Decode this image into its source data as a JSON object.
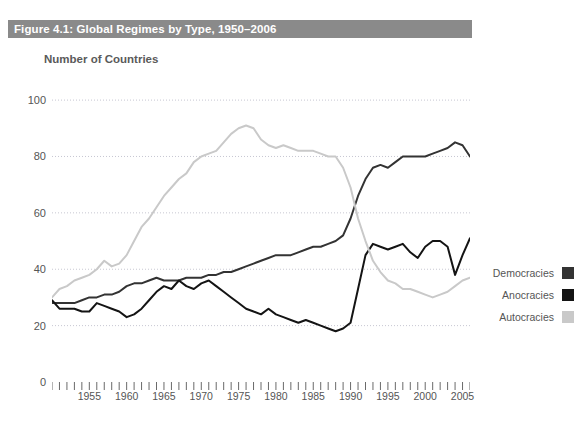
{
  "figure": {
    "title": "Figure 4.1: Global Regimes by Type, 1950–2006",
    "axis_title": "Number of Countries"
  },
  "legend": {
    "position": "right",
    "items": [
      {
        "label": "Democracies",
        "color": "#333333",
        "swatch_name": "legend-swatch-democracies"
      },
      {
        "label": "Anocracies",
        "color": "#141414",
        "swatch_name": "legend-swatch-anocracies"
      },
      {
        "label": "Autocracies",
        "color": "#c9c9c9",
        "swatch_name": "legend-swatch-autocracies"
      }
    ]
  },
  "axes": {
    "y_ticks": [
      "0",
      "20",
      "40",
      "60",
      "80",
      "100"
    ],
    "y_tick_values": [
      0,
      20,
      40,
      60,
      80,
      100
    ],
    "x_ticks": [
      "1955",
      "1960",
      "1965",
      "1970",
      "1975",
      "1980",
      "1985",
      "1990",
      "1995",
      "2000",
      "2005"
    ],
    "x_tick_values": [
      1955,
      1960,
      1965,
      1970,
      1975,
      1980,
      1985,
      1990,
      1995,
      2000,
      2005
    ],
    "grid": "horizontal-dotted"
  },
  "chart_data": {
    "type": "line",
    "title": "Figure 4.1: Global Regimes by Type, 1950–2006",
    "xlabel": "",
    "ylabel": "Number of Countries",
    "xlim": [
      1950,
      2006
    ],
    "ylim": [
      0,
      105
    ],
    "grid": true,
    "legend_position": "right",
    "x": [
      1950,
      1951,
      1952,
      1953,
      1954,
      1955,
      1956,
      1957,
      1958,
      1959,
      1960,
      1961,
      1962,
      1963,
      1964,
      1965,
      1966,
      1967,
      1968,
      1969,
      1970,
      1971,
      1972,
      1973,
      1974,
      1975,
      1976,
      1977,
      1978,
      1979,
      1980,
      1981,
      1982,
      1983,
      1984,
      1985,
      1986,
      1987,
      1988,
      1989,
      1990,
      1991,
      1992,
      1993,
      1994,
      1995,
      1996,
      1997,
      1998,
      1999,
      2000,
      2001,
      2002,
      2003,
      2004,
      2005,
      2006
    ],
    "series": [
      {
        "name": "Democracies",
        "color": "#333333",
        "values": [
          28,
          28,
          28,
          28,
          29,
          30,
          30,
          31,
          31,
          32,
          34,
          35,
          35,
          36,
          37,
          36,
          36,
          36,
          37,
          37,
          37,
          38,
          38,
          39,
          39,
          40,
          41,
          42,
          43,
          44,
          45,
          45,
          45,
          46,
          47,
          48,
          48,
          49,
          50,
          52,
          58,
          66,
          72,
          76,
          77,
          76,
          78,
          80,
          80,
          80,
          80,
          81,
          82,
          83,
          85,
          84,
          80
        ]
      },
      {
        "name": "Anocracies",
        "color": "#141414",
        "values": [
          29,
          26,
          26,
          26,
          25,
          25,
          28,
          27,
          26,
          25,
          23,
          24,
          26,
          29,
          32,
          34,
          33,
          36,
          34,
          33,
          35,
          36,
          34,
          32,
          30,
          28,
          26,
          25,
          24,
          26,
          24,
          23,
          22,
          21,
          22,
          21,
          20,
          19,
          18,
          19,
          21,
          33,
          45,
          49,
          48,
          47,
          48,
          49,
          46,
          44,
          48,
          50,
          50,
          48,
          38,
          45,
          51
        ]
      },
      {
        "name": "Autocracies",
        "color": "#c9c9c9",
        "values": [
          30,
          33,
          34,
          36,
          37,
          38,
          40,
          43,
          41,
          42,
          45,
          50,
          55,
          58,
          62,
          66,
          69,
          72,
          74,
          78,
          80,
          81,
          82,
          85,
          88,
          90,
          91,
          90,
          86,
          84,
          83,
          84,
          83,
          82,
          82,
          82,
          81,
          80,
          80,
          76,
          69,
          58,
          50,
          43,
          39,
          36,
          35,
          33,
          33,
          32,
          31,
          30,
          31,
          32,
          34,
          36,
          37
        ]
      }
    ]
  }
}
